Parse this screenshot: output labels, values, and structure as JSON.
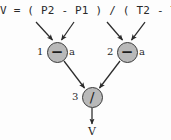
{
  "diagram": {
    "formula": "V = ( P2 - P1 ) / ( T2 - T1 )",
    "output_label": "V",
    "colors": {
      "node_fill": "#b9b9b9",
      "node_stroke": "#3a3a3a",
      "wire": "#2b2b2b",
      "text": "#2a2a2a",
      "background": "#fdfdfd"
    },
    "nodes": [
      {
        "id": "1",
        "index_label": "1",
        "operator": "−",
        "operator_name": "minus-operator",
        "right_label": "a"
      },
      {
        "id": "2",
        "index_label": "2",
        "operator": "−",
        "operator_name": "minus-operator",
        "right_label": "a"
      },
      {
        "id": "3",
        "index_label": "3",
        "operator": "/",
        "operator_name": "divide-operator",
        "right_label": ""
      }
    ]
  }
}
